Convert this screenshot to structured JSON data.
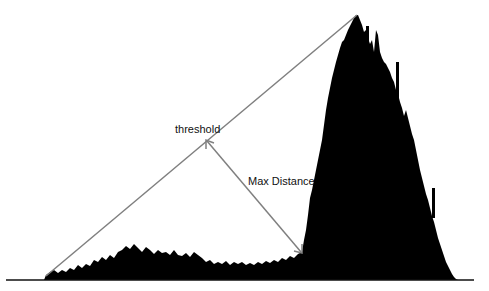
{
  "diagram": {
    "type": "histogram-threshold-triangle-method",
    "labels": {
      "threshold": "threshold",
      "max_distance": "Max Distance"
    },
    "colors": {
      "histogram": "#000000",
      "lines": "#808080",
      "background": "#ffffff"
    },
    "elements": {
      "baseline": {
        "x1": 6,
        "y1": 280,
        "x2": 474,
        "y2": 280
      },
      "triangle_line": {
        "from": [
          46,
          276
        ],
        "to": [
          357,
          15
        ]
      },
      "max_distance_arrow": {
        "from": [
          206,
          140
        ],
        "to": [
          302,
          253
        ]
      },
      "peak_point": [
        357,
        15
      ]
    }
  }
}
